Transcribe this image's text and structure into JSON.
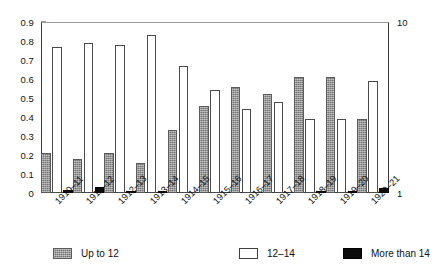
{
  "chart_data": {
    "type": "bar",
    "title": "",
    "subtitle": "",
    "xlabel": "",
    "ylabel": "",
    "grid": false,
    "legend_position": "bottom",
    "categories": [
      "1910–11",
      "1911–12",
      "1912–13",
      "1913–14",
      "1914–15",
      "1915–16",
      "1916–17",
      "1917–18",
      "1918–19",
      "1919–20",
      "1920–21"
    ],
    "ylim": [
      0,
      0.9
    ],
    "yticks": [
      "0",
      "0.1",
      "0.2",
      "0.3",
      "0.4",
      "0.5",
      "0.6",
      "0.7",
      "0.8",
      "0.9"
    ],
    "ytick_values": [
      0,
      0.1,
      0.2,
      0.3,
      0.4,
      0.5,
      0.6,
      0.7,
      0.8,
      0.9
    ],
    "y2lim": [
      1,
      10
    ],
    "y2ticks": [
      "1",
      "10"
    ],
    "y2tick_values": [
      1,
      10
    ],
    "series": [
      {
        "name": "Up to 12",
        "color": "#8d8d8d",
        "values": [
          0.21,
          0.18,
          0.21,
          0.16,
          0.33,
          0.46,
          0.56,
          0.52,
          0.61,
          0.61,
          0.39
        ]
      },
      {
        "name": "12–14",
        "color": "#ffffff",
        "values": [
          0.77,
          0.79,
          0.78,
          0.83,
          0.67,
          0.54,
          0.44,
          0.48,
          0.39,
          0.39,
          0.59
        ]
      },
      {
        "name": "More than 14",
        "color": "#0b0b0b",
        "values": [
          0.015,
          0.03,
          0.008,
          0.008,
          0.0,
          0.0,
          0.0,
          0.0,
          0.008,
          0.008,
          0.025
        ]
      }
    ]
  },
  "legend": {
    "items": [
      {
        "label": "Up to 12",
        "swatch": "gray-swatch-icon"
      },
      {
        "label": "12–14",
        "swatch": "white-swatch-icon"
      },
      {
        "label": "More than 14",
        "swatch": "black-swatch-icon"
      }
    ]
  }
}
